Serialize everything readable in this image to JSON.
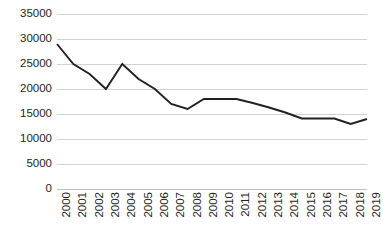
{
  "chart_data": {
    "type": "line",
    "title": "",
    "subtitle": "",
    "xlabel": "",
    "ylabel": "",
    "categories": [
      "2000",
      "2001",
      "2002",
      "2003",
      "2004",
      "2005",
      "2006",
      "2007",
      "2008",
      "2009",
      "2010",
      "2011",
      "2012",
      "2013",
      "2014",
      "2015",
      "2016",
      "2017",
      "2018",
      "2019"
    ],
    "values": [
      29000,
      25000,
      23000,
      20000,
      25000,
      22000,
      20000,
      17000,
      16000,
      18000,
      18000,
      18000,
      17200,
      16300,
      15300,
      14100,
      14100,
      14100,
      13000,
      14000
    ],
    "series": [
      {
        "name": "",
        "values": [
          29000,
          25000,
          23000,
          20000,
          25000,
          22000,
          20000,
          17000,
          16000,
          18000,
          18000,
          18000,
          17200,
          16300,
          15300,
          14100,
          14100,
          14100,
          13000,
          14000
        ]
      }
    ],
    "ylim": [
      0,
      35000
    ],
    "yticks": [
      0,
      5000,
      10000,
      15000,
      20000,
      25000,
      30000,
      35000
    ],
    "ytick_labels": [
      "0",
      "5000",
      "10000",
      "15000",
      "20000",
      "25000",
      "30000",
      "35000"
    ],
    "grid": true,
    "grid_axis": "y",
    "legend": false,
    "legend_position": "none",
    "markers": false,
    "line_color": "#231f20",
    "grid_color": "#d2d2d2",
    "background_color": "#ffffff",
    "x_tick_rotation": -90
  }
}
